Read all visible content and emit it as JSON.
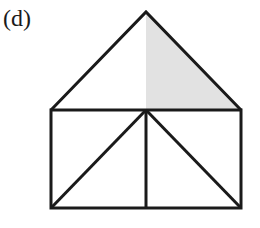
{
  "label": "(d)",
  "figure": {
    "apex": [
      146,
      12
    ],
    "roof_base_left": [
      51,
      110
    ],
    "roof_base_right": [
      241,
      110
    ],
    "rect_bottom_left": [
      51,
      208
    ],
    "rect_bottom_right": [
      241,
      208
    ],
    "center_top": [
      146,
      110
    ],
    "center_bottom": [
      146,
      208
    ],
    "shaded_region": "right half of roof triangle",
    "colors": {
      "stroke": "#1a1a1a",
      "shade": "#e2e2e2",
      "background": "#ffffff"
    }
  }
}
